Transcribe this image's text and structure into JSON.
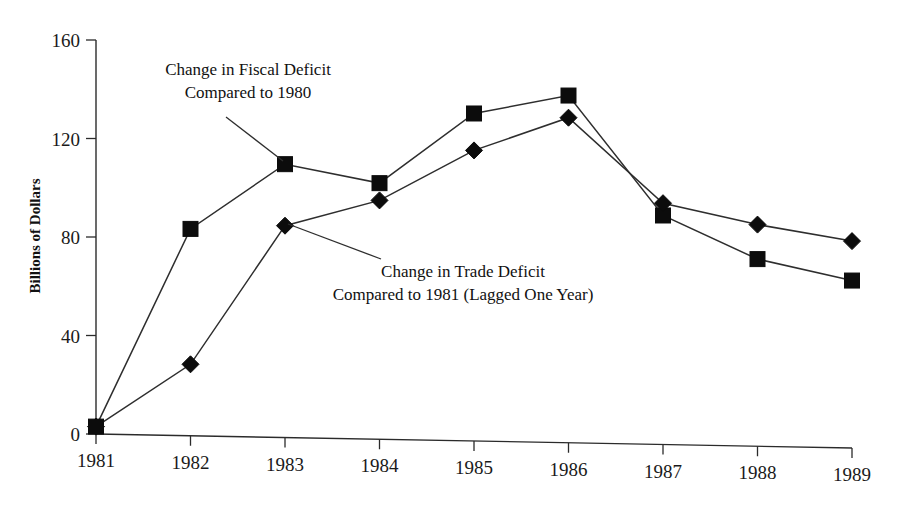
{
  "chart_data": {
    "type": "line",
    "title": "",
    "xlabel": "",
    "ylabel": "Billions of Dollars",
    "x": [
      "1981",
      "1982",
      "1983",
      "1984",
      "1985",
      "1986",
      "1987",
      "1988",
      "1989"
    ],
    "categories": [
      "1981",
      "1982",
      "1983",
      "1984",
      "1985",
      "1986",
      "1987",
      "1988",
      "1989"
    ],
    "xlim": [
      1981,
      1989
    ],
    "ylim": [
      0,
      160
    ],
    "yticks": [
      "0",
      "40",
      "80",
      "120",
      "160"
    ],
    "ytick_values": [
      0,
      40,
      80,
      120,
      160
    ],
    "grid": false,
    "legend": "none",
    "series": [
      {
        "name": "Change in Fiscal Deficit Compared to 1980",
        "marker": "square",
        "values": [
          3,
          84,
          111,
          104,
          133,
          141,
          93,
          76,
          68
        ]
      },
      {
        "name": "Change in Trade Deficit Compared to 1981 (Lagged One Year)",
        "marker": "diamond",
        "values": [
          3,
          29,
          86,
          97,
          118,
          132,
          98,
          90,
          84
        ]
      }
    ],
    "annotations": [
      {
        "id": "fiscal-deficit-annotation",
        "lines": [
          "Change in Fiscal Deficit",
          "Compared to 1980"
        ],
        "points_to": {
          "x": "1983",
          "series": "Change in Fiscal Deficit Compared to 1980"
        }
      },
      {
        "id": "trade-deficit-annotation",
        "lines": [
          "Change in Trade Deficit",
          "Compared to 1981 (Lagged One Year)"
        ],
        "points_to": {
          "x": "1983",
          "series": "Change in Trade Deficit Compared to 1981 (Lagged One Year)"
        }
      }
    ],
    "colors": {
      "marker": "#0c0c0c",
      "line": "#2e2e2e",
      "axis": "#2b2b2b",
      "text": "#111111",
      "background": "#ffffff"
    }
  }
}
